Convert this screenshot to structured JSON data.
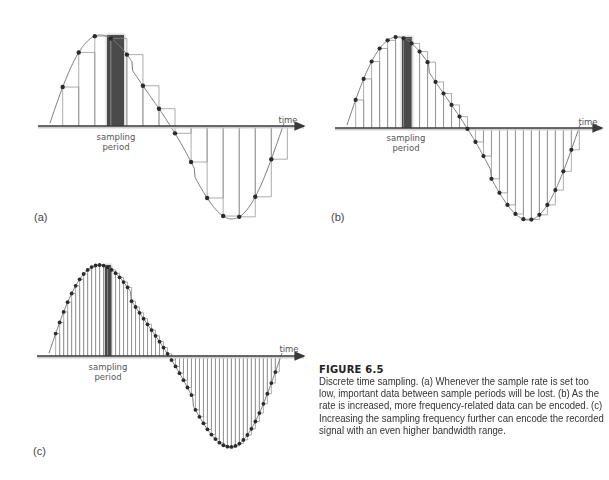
{
  "figure": {
    "number_label": "FIGURE 6.5",
    "caption": "Discrete time sampling. (a) Whenever the sample rate is set too low, important data between sample periods will be lost. (b) As the rate is increased, more frequency-related data can be encoded. (c) Increasing the sampling frequency further can encode the recorded signal with an even higher bandwidth range."
  },
  "panels": [
    {
      "id": "a",
      "tag": "(a)",
      "axis_label": "time",
      "bar_label_line1": "sampling",
      "bar_label_line2": "period",
      "samples": 14
    },
    {
      "id": "b",
      "tag": "(b)",
      "axis_label": "time",
      "bar_label_line1": "sampling",
      "bar_label_line2": "period",
      "samples": 28
    },
    {
      "id": "c",
      "tag": "(c)",
      "axis_label": "time",
      "bar_label_line1": "sampling",
      "bar_label_line2": "period",
      "samples": 56
    }
  ],
  "colors": {
    "curve": "#7a7a7a",
    "axis": "#3a3a3a",
    "dot": "#2b2b2b",
    "bar": "#4a4a4a",
    "stem": "#8a8a8a"
  }
}
